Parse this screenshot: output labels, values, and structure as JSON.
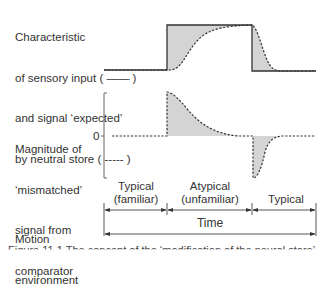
{
  "panels": {
    "top": {
      "label_lines": [
        "Characteristic",
        "of sensory input ( —— )",
        "and signal ‘expected’",
        "by neutral store ( ----- )"
      ]
    },
    "middle": {
      "label_lines": [
        "Magnitude of",
        "‘mismatched’",
        "signal from",
        "comparator"
      ],
      "zero_tick": "0"
    },
    "bottom": {
      "label_lines": [
        "Motion",
        "environment"
      ],
      "phases": [
        {
          "line1": "Typical",
          "line2": "(familiar)"
        },
        {
          "line1": "Atypical",
          "line2": "(unfamiliar)"
        },
        {
          "line1": "Typical",
          "line2": ""
        }
      ],
      "time_label": "Time"
    }
  },
  "caption": "Figure 11.1   The concept of the ‘modification of the neural store’",
  "colors": {
    "shade": "#d4d4d4",
    "line": "#333333"
  }
}
